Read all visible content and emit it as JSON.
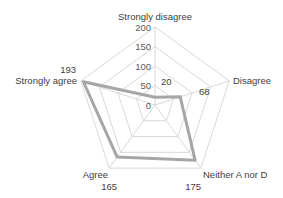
{
  "chart_data": {
    "type": "radar",
    "title": "",
    "categories": [
      "Strongly disagree",
      "Disagree",
      "Neither A nor D",
      "Agree",
      "Strongly agree"
    ],
    "series": [
      {
        "name": "Responses",
        "values": [
          20,
          68,
          175,
          165,
          193
        ]
      }
    ],
    "data_labels": [
      "20",
      "68",
      "175",
      "165",
      "193"
    ],
    "axis": {
      "min": 0,
      "max": 200,
      "step": 50,
      "tick_labels": [
        "0",
        "50",
        "100",
        "150",
        "200"
      ]
    },
    "grid": true,
    "legend": "none",
    "colors": {
      "series_line": "#a6a6a6",
      "grid": "#d9d9d9",
      "text": "#404040"
    }
  }
}
